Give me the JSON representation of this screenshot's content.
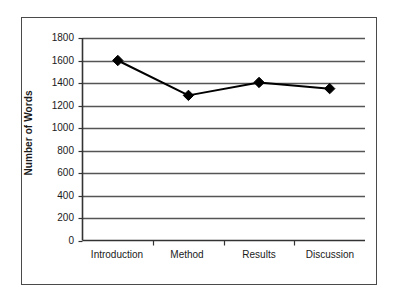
{
  "chart_data": {
    "type": "line",
    "title": "",
    "subtitle": "",
    "xlabel": "",
    "ylabel": "Number of Words",
    "categories": [
      "Introduction",
      "Method",
      "Results",
      "Discussion"
    ],
    "values": [
      1600,
      1290,
      1405,
      1350
    ],
    "series": [
      {
        "name": "Number of Words",
        "values": [
          1600,
          1290,
          1405,
          1350
        ]
      }
    ],
    "ylim": [
      0,
      1800
    ],
    "ytick_labels": [
      "1800",
      "1600",
      "1400",
      "1200",
      "1000",
      "800",
      "600",
      "400",
      "200",
      "0"
    ],
    "ytick_values": [
      1800,
      1600,
      1400,
      1200,
      1000,
      800,
      600,
      400,
      200,
      0
    ],
    "ytick_step": 200,
    "grid": "horizontal",
    "legend": "none",
    "marker": "diamond",
    "line_color": "#000000",
    "marker_color": "#000000",
    "grid_color": "#555555",
    "axis_color": "#333333",
    "background_color": "#ffffff",
    "border_color": "#4a4a4a"
  }
}
